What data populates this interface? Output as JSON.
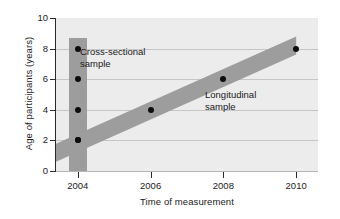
{
  "chart_data": {
    "type": "scatter",
    "title": "",
    "xlabel": "Time of measurement",
    "ylabel": "Age of participants (years)",
    "xlim": [
      2003.4,
      2010.6
    ],
    "ylim": [
      0,
      10
    ],
    "xticks": [
      "2004",
      "2006",
      "2008",
      "2010"
    ],
    "xtick_values": [
      2004,
      2006,
      2008,
      2010
    ],
    "yticks": [
      "0",
      "2",
      "4",
      "6",
      "8",
      "10"
    ],
    "ytick_values": [
      0,
      2,
      4,
      6,
      8,
      10
    ],
    "grid": "horizontal",
    "legend": "none",
    "plot_background": "#ececec",
    "band_color": "#9d9d9d",
    "point_color": "#0d0d0d",
    "series": [
      {
        "name": "Cross-sectional sample",
        "x": [
          2004,
          2004,
          2004,
          2004
        ],
        "values": [
          2,
          4,
          6,
          8
        ]
      },
      {
        "name": "Longitudinal sample",
        "x": [
          2004,
          2006,
          2008,
          2010
        ],
        "values": [
          2,
          4,
          6,
          8
        ]
      }
    ],
    "annotations": [
      {
        "text_line1": "Cross-sectional",
        "text_line2": "sample",
        "x": 2004.6,
        "y": 7.5
      },
      {
        "text_line1": "Longitudinal",
        "text_line2": "sample",
        "x": 2008.2,
        "y": 4.9
      }
    ],
    "bands": [
      {
        "name": "cross-sectional-band",
        "orientation": "vertical",
        "x": 2004,
        "y_from": 0,
        "y_to": 8.7
      },
      {
        "name": "longitudinal-band",
        "orientation": "diagonal",
        "x_from": 2003.4,
        "x_to": 2010,
        "y_from": 1.2,
        "y_to": 8.2
      }
    ]
  },
  "axis": {
    "ylabel": "Age of participants (years)",
    "xlabel": "Time of measurement",
    "yticks": [
      {
        "label": "10",
        "value": 10
      },
      {
        "label": "8",
        "value": 8
      },
      {
        "label": "6",
        "value": 6
      },
      {
        "label": "4",
        "value": 4
      },
      {
        "label": "2",
        "value": 2
      },
      {
        "label": "0",
        "value": 0
      }
    ],
    "xticks": [
      {
        "label": "2004",
        "value": 2004
      },
      {
        "label": "2006",
        "value": 2006
      },
      {
        "label": "2008",
        "value": 2008
      },
      {
        "label": "2010",
        "value": 2010
      }
    ]
  },
  "annotations": {
    "cross_line1": "Cross-sectional",
    "cross_line2": "sample",
    "long_line1": "Longitudinal",
    "long_line2": "sample"
  }
}
